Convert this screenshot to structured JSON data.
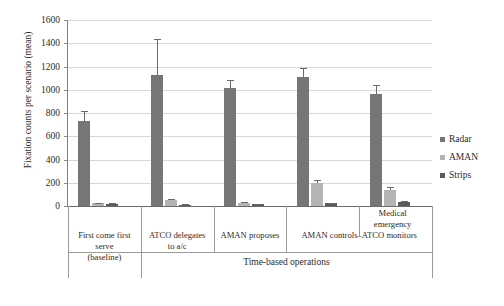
{
  "chart_data": {
    "type": "bar",
    "title": "",
    "xlabel": "Time-based operations",
    "ylabel": "Fixation counts per scenario (mean)",
    "ylim": [
      0,
      1600
    ],
    "yticks": [
      0,
      200,
      400,
      600,
      800,
      1000,
      1200,
      1400,
      1600
    ],
    "ytick_labels": [
      "0",
      "200",
      "400",
      "600",
      "800",
      "1000",
      "1200",
      "1400",
      "1600"
    ],
    "grid": true,
    "legend_position": "right",
    "categories": [
      "First come first serve (baseline)",
      "ATCO delegates to a/c",
      "AMAN proposes",
      "AMAN controls–ATCO monitors",
      "Medical emergency"
    ],
    "category_lines": [
      [
        "First come first",
        "serve",
        "(baseline)"
      ],
      [
        "ATCO delegates",
        "to a/c"
      ],
      [
        "AMAN proposes"
      ],
      [
        "AMAN controls–ATCO monitors"
      ],
      [
        "Medical",
        "emergency"
      ]
    ],
    "group_label": "Time-based operations",
    "series": [
      {
        "name": "Radar",
        "color": "#767676",
        "values": [
          735,
          1130,
          1015,
          1110,
          960
        ],
        "errors": [
          78,
          305,
          65,
          75,
          80
        ]
      },
      {
        "name": "AMAN",
        "color": "#b4b4b4",
        "values": [
          22,
          48,
          28,
          200,
          140
        ],
        "errors": [
          6,
          10,
          7,
          22,
          24
        ]
      },
      {
        "name": "Strips",
        "color": "#5a5a5a",
        "values": [
          18,
          12,
          16,
          24,
          34
        ],
        "errors": [
          5,
          4,
          5,
          6,
          8
        ]
      }
    ]
  },
  "legend": {
    "items": [
      {
        "label": "Radar",
        "color": "#767676"
      },
      {
        "label": "AMAN",
        "color": "#b4b4b4"
      },
      {
        "label": "Strips",
        "color": "#5a5a5a"
      }
    ]
  },
  "axes": {
    "y_title": "Fixation counts per scenario (mean)",
    "x_group_title": "Time-based operations"
  }
}
